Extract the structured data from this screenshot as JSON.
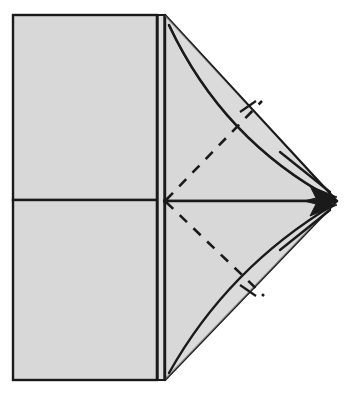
{
  "figure": {
    "kind": "origami-fold-diagram",
    "canvas": {
      "width": 356,
      "height": 406
    },
    "colors": {
      "background": "#ffffff",
      "paper_fill": "#d8d8d8",
      "paper_fill_light": "#dedede",
      "stroke": "#1a1a1a",
      "dashed_stroke": "#1a1a1a"
    },
    "stroke_widths": {
      "outline": 2.4,
      "inner_edge": 1.6,
      "crease_dashed": 2.6,
      "tick": 2.2,
      "arrow": 2.4
    },
    "geometry": {
      "left_panel": {
        "x_left": 13,
        "x_right": 157,
        "y_top": 15,
        "y_bottom": 380,
        "center_y": 200,
        "description": "Left rectangle split by a horizontal center crease line"
      },
      "spine": {
        "x_outer": 157,
        "x_inner": 165,
        "y_top": 15,
        "y_bottom": 380,
        "description": "Narrow vertical band of two close vertical edges forming folded spine"
      },
      "apex": {
        "x": 337,
        "y": 201
      },
      "top_triangle": {
        "p1": {
          "x": 165,
          "y": 15
        },
        "p2": {
          "x": 337,
          "y": 201
        },
        "p3": {
          "x": 165,
          "y": 201
        }
      },
      "bottom_triangle": {
        "p1": {
          "x": 165,
          "y": 380
        },
        "p2": {
          "x": 337,
          "y": 201
        },
        "p3": {
          "x": 165,
          "y": 201
        }
      },
      "top_arc": {
        "start": {
          "x": 169,
          "y": 25
        },
        "control": {
          "x": 223,
          "y": 140
        },
        "end": {
          "x": 333,
          "y": 199
        },
        "description": "Curved fold-motion arc sweeping from the top corner to the apex"
      },
      "bottom_arc": {
        "start": {
          "x": 169,
          "y": 373
        },
        "control": {
          "x": 228,
          "y": 268
        },
        "end": {
          "x": 333,
          "y": 205
        },
        "description": "Curved fold-motion arc sweeping from the bottom corner to the apex"
      },
      "top_crease_dashed": {
        "start": {
          "x": 166,
          "y": 200
        },
        "end": {
          "x": 262,
          "y": 101
        }
      },
      "bottom_crease_dashed": {
        "start": {
          "x": 166,
          "y": 202
        },
        "end": {
          "x": 264,
          "y": 296
        }
      },
      "top_tick": {
        "start": {
          "x": 240,
          "y": 112
        },
        "end": {
          "x": 256,
          "y": 101
        },
        "description": "Short perpendicular tick mark across the upper straight edge"
      },
      "bottom_tick": {
        "start": {
          "x": 240,
          "y": 285
        },
        "end": {
          "x": 256,
          "y": 296
        },
        "description": "Short perpendicular tick mark across the lower straight edge"
      },
      "top_arrow": {
        "tip": {
          "x": 337,
          "y": 197
        },
        "tail": {
          "x": 280,
          "y": 152
        },
        "direction": "down-right toward apex"
      },
      "bottom_arrow": {
        "tip": {
          "x": 337,
          "y": 205
        },
        "tail": {
          "x": 280,
          "y": 250
        },
        "direction": "up-right toward apex"
      }
    },
    "labels": {
      "left_panel": "left paper panel",
      "spine": "folded spine edge",
      "top_flap": "upper flap",
      "bottom_flap": "lower flap",
      "apex": "fold apex point",
      "top_crease": "upper valley crease",
      "bottom_crease": "lower valley crease",
      "top_arrow": "upper fold arrow",
      "bottom_arrow": "lower fold arrow"
    }
  }
}
